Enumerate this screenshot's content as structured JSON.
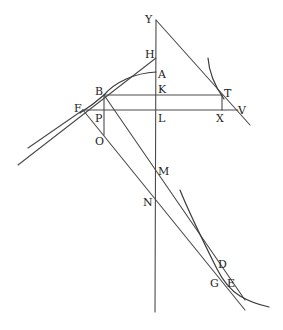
{
  "diagram": {
    "type": "geometric-construction",
    "stroke_color": "#4a4a4a",
    "background": "#ffffff",
    "points": {
      "Y": {
        "label": "Y",
        "x": 156,
        "y": 20
      },
      "H": {
        "label": "H",
        "x": 156,
        "y": 58
      },
      "A": {
        "label": "A",
        "x": 156,
        "y": 72
      },
      "K": {
        "label": "K",
        "x": 156,
        "y": 95
      },
      "L": {
        "label": "L",
        "x": 156,
        "y": 110
      },
      "M": {
        "label": "M",
        "x": 156,
        "y": 172
      },
      "N": {
        "label": "N",
        "x": 156,
        "y": 205
      },
      "B": {
        "label": "B",
        "x": 104,
        "y": 95
      },
      "T": {
        "label": "T",
        "x": 222,
        "y": 95
      },
      "F": {
        "label": "F",
        "x": 83,
        "y": 110
      },
      "P": {
        "label": "P",
        "x": 104,
        "y": 110
      },
      "X": {
        "label": "X",
        "x": 222,
        "y": 110
      },
      "V": {
        "label": "V",
        "x": 238,
        "y": 110
      },
      "O": {
        "label": "O",
        "x": 104,
        "y": 135
      },
      "D": {
        "label": "D",
        "x": 217,
        "y": 269
      },
      "G": {
        "label": "G",
        "x": 221,
        "y": 282
      },
      "E": {
        "label": "E",
        "x": 225,
        "y": 282
      }
    },
    "labels": [
      "Y",
      "H",
      "A",
      "K",
      "L",
      "M",
      "N",
      "B",
      "T",
      "F",
      "P",
      "X",
      "V",
      "O",
      "D",
      "G",
      "E"
    ]
  }
}
